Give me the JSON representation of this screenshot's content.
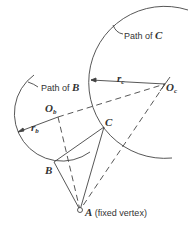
{
  "diagram": {
    "labels": {
      "path_c": "Path of",
      "path_c_var": "C",
      "path_b": "Path of",
      "path_b_var": "B",
      "r_c": "r",
      "r_c_sub": "c",
      "r_b": "r",
      "r_b_sub": "b",
      "o_c": "O",
      "o_c_sub": "c",
      "o_b": "O",
      "o_b_sub": "b",
      "vertex_a": "A",
      "vertex_a_note": "(fixed vertex)",
      "vertex_b": "B",
      "vertex_c": "C"
    },
    "points": {
      "A": [
        80,
        210
      ],
      "B": [
        54,
        162
      ],
      "C": [
        104,
        127
      ],
      "Ob": [
        58,
        117
      ],
      "Oc": [
        165,
        84
      ]
    },
    "colors": {
      "line": "#444444",
      "text": "#333333"
    }
  }
}
